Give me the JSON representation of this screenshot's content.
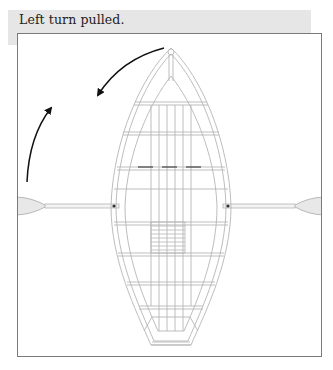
{
  "caption": {
    "text": "Left turn pulled."
  },
  "diagram": {
    "arrows": [
      {
        "name": "bow-turn-arrow",
        "direction": "counterclockwise-left"
      },
      {
        "name": "port-oar-arrow",
        "direction": "forward-up"
      }
    ],
    "colors": {
      "band": "#e6e6e6",
      "frame": "#7a7a7a",
      "line": "#b5b5b5",
      "arrow": "#111111",
      "blade": "#e8e8e8"
    }
  }
}
